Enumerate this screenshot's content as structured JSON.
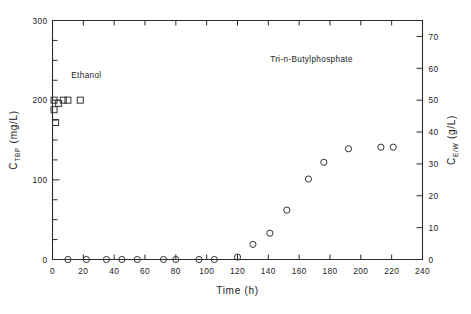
{
  "chart_data": {
    "type": "scatter",
    "title": "",
    "xlabel": "Time  (h)",
    "ylabel_left": "C",
    "ylabel_left_sub": "TBP",
    "ylabel_left_unit": "(mg/L)",
    "ylabel_right": "C",
    "ylabel_right_sub": "E/W",
    "ylabel_right_unit": "(g/L)",
    "xlim": [
      0,
      240
    ],
    "ylim_left": [
      0,
      300
    ],
    "ylim_right": [
      0,
      75
    ],
    "xticks": [
      0,
      20,
      40,
      60,
      80,
      100,
      120,
      140,
      160,
      180,
      200,
      220,
      240
    ],
    "xtick_labels": [
      "0",
      "20",
      "40",
      "60",
      "80",
      "100",
      "120",
      "140",
      "160",
      "180",
      "200",
      "220",
      "240"
    ],
    "yticks_left": [
      0,
      25,
      50,
      75,
      100,
      125,
      150,
      175,
      200,
      225,
      250,
      275,
      300
    ],
    "ytick_labels_left": [
      "0",
      "",
      "",
      "",
      "100",
      "",
      "",
      "",
      "200",
      "",
      "",
      "",
      "300"
    ],
    "yticks_right": [
      0,
      10,
      20,
      30,
      40,
      50,
      60,
      70
    ],
    "ytick_labels_right": [
      "0",
      "10",
      "20",
      "30",
      "40",
      "50",
      "60",
      "70"
    ],
    "grid": false,
    "legend_position": "in-plot-annotations",
    "series": [
      {
        "name": "Ethanol",
        "marker": "square",
        "axis": "right",
        "annotation": "Ethanol",
        "annotation_x": 22,
        "annotation_y": 57,
        "points": [
          {
            "x": 1,
            "y": 47
          },
          {
            "x": 1,
            "y": 50
          },
          {
            "x": 2,
            "y": 43
          },
          {
            "x": 4,
            "y": 49
          },
          {
            "x": 7,
            "y": 50
          },
          {
            "x": 10,
            "y": 50
          },
          {
            "x": 18,
            "y": 50
          }
        ]
      },
      {
        "name": "Tri-n-Butylphosphate",
        "marker": "circle",
        "axis": "left",
        "annotation": "Tri-n-Butylphosphate",
        "annotation_x": 168,
        "annotation_y": 248,
        "points": [
          {
            "x": 10,
            "y": 0
          },
          {
            "x": 22,
            "y": 0
          },
          {
            "x": 35,
            "y": 0
          },
          {
            "x": 45,
            "y": 0
          },
          {
            "x": 55,
            "y": 0
          },
          {
            "x": 72,
            "y": 0
          },
          {
            "x": 80,
            "y": 0
          },
          {
            "x": 95,
            "y": 0
          },
          {
            "x": 105,
            "y": 0
          },
          {
            "x": 120,
            "y": 3
          },
          {
            "x": 130,
            "y": 19
          },
          {
            "x": 141,
            "y": 33
          },
          {
            "x": 152,
            "y": 62
          },
          {
            "x": 166,
            "y": 101
          },
          {
            "x": 176,
            "y": 122
          },
          {
            "x": 192,
            "y": 139
          },
          {
            "x": 213,
            "y": 141
          },
          {
            "x": 221,
            "y": 141
          }
        ]
      }
    ]
  }
}
